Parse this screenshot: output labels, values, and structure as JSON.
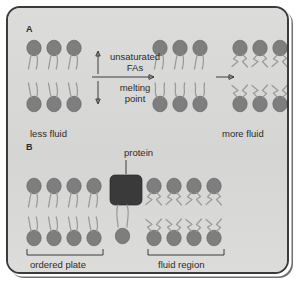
{
  "figure": {
    "background_color": "#d8d8d6",
    "frame_color": "#3b3b3b",
    "lipid_head_color": "#7e7e7e",
    "lipid_tail_color": "#9a9a98",
    "protein_color": "#3a3a3a"
  },
  "panel_a": {
    "letter": "A",
    "left_caption": "less fluid",
    "right_caption": "more fluid",
    "arrow_up_label": "unsaturated\nFAs",
    "arrow_up_line1": "unsaturated",
    "arrow_up_line2": "FAs",
    "arrow_down_line1": "melting",
    "arrow_down_line2": "point",
    "up_arrow_icon": "arrow-up-icon",
    "down_arrow_icon": "arrow-down-icon",
    "transition_arrow_icon": "arrow-right-icon",
    "groups": [
      {
        "name": "less-fluid-bilayer",
        "lipid_pairs": 3,
        "tail_type": "straight"
      },
      {
        "name": "intermediate-bilayer",
        "lipid_pairs": 3,
        "tail_type": "mixed"
      },
      {
        "name": "more-fluid-bilayer",
        "lipid_pairs": 3,
        "tail_type": "kinked"
      }
    ]
  },
  "panel_b": {
    "letter": "B",
    "protein_label": "protein",
    "left_bracket_label": "ordered plate",
    "right_bracket_label": "fluid region",
    "groups": [
      {
        "name": "ordered-plate-bilayer",
        "lipid_pairs": 4,
        "tail_type": "straight"
      },
      {
        "name": "fluid-region-bilayer",
        "lipid_pairs": 4,
        "tail_type": "kinked"
      }
    ],
    "protein_shape": "rounded-rectangle"
  }
}
